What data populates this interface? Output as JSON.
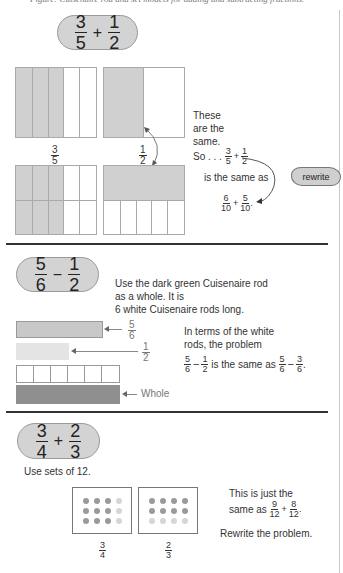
{
  "page_caption": "Figure: Cuisenaire rod and set models for adding and subtracting fractions.",
  "section1": {
    "problem": {
      "a": {
        "n": "3",
        "d": "5"
      },
      "op": "+",
      "b": {
        "n": "1",
        "d": "2"
      }
    },
    "top_left_label": {
      "n": "3",
      "d": "5"
    },
    "top_right_label": {
      "n": "1",
      "d": "2"
    },
    "note_lines": [
      "These",
      "are the",
      "same."
    ],
    "so_text": "So . . .",
    "so_expr": {
      "a": {
        "n": "3",
        "d": "5"
      },
      "op": "+",
      "b": {
        "n": "1",
        "d": "2"
      }
    },
    "same_as_text": "is the same as",
    "result_expr": {
      "a": {
        "n": "6",
        "d": "10"
      },
      "op": "+",
      "b": {
        "n": "5",
        "d": "10"
      },
      "end": "."
    },
    "cloud_label": "rewrite"
  },
  "section2": {
    "problem": {
      "a": {
        "n": "5",
        "d": "6"
      },
      "op": "−",
      "b": {
        "n": "1",
        "d": "2"
      }
    },
    "intro_lines": [
      "Use the dark green Cuisenaire rod",
      "as a whole. It is",
      "6 white Cuisenaire rods long."
    ],
    "rod_labels": {
      "five_sixths": {
        "n": "5",
        "d": "6"
      },
      "one_half": {
        "n": "1",
        "d": "2"
      },
      "whole": "Whole"
    },
    "terms_lines": [
      "In terms of the white",
      "rods, the problem"
    ],
    "compare": {
      "lhs": {
        "a": {
          "n": "5",
          "d": "6"
        },
        "op": "−",
        "b": {
          "n": "1",
          "d": "2"
        }
      },
      "mid": "is the same as",
      "rhs": {
        "a": {
          "n": "5",
          "d": "6"
        },
        "op": "−",
        "b": {
          "n": "3",
          "d": "6"
        },
        "end": "."
      }
    }
  },
  "section3": {
    "problem": {
      "a": {
        "n": "3",
        "d": "4"
      },
      "op": "+",
      "b": {
        "n": "2",
        "d": "3"
      }
    },
    "intro": "Use sets of 12.",
    "box_labels": [
      {
        "n": "3",
        "d": "4"
      },
      {
        "n": "2",
        "d": "3"
      }
    ],
    "note_line1": "This is just the",
    "note_line2_prefix": "same as",
    "note_expr": {
      "a": {
        "n": "9",
        "d": "12"
      },
      "op": "+",
      "b": {
        "n": "8",
        "d": "12"
      },
      "end": "."
    },
    "instruction": "Rewrite the problem."
  },
  "colors": {
    "shade": "#d0d0d0",
    "dark_rod": "#8f8f8f",
    "light_rod": "#e4e4e4",
    "mid_rod": "#c8c8c8",
    "pill": "#d3d3d3"
  }
}
